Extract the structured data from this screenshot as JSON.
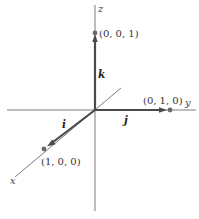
{
  "diagram": {
    "axes": {
      "x": {
        "label": "x"
      },
      "y": {
        "label": "y"
      },
      "z": {
        "label": "z"
      }
    },
    "vectors": [
      {
        "name": "i",
        "label": "i",
        "from": [
          0,
          0,
          0
        ],
        "to": [
          1,
          0,
          0
        ]
      },
      {
        "name": "j",
        "label": "j",
        "from": [
          0,
          0,
          0
        ],
        "to": [
          0,
          1,
          0
        ]
      },
      {
        "name": "k",
        "label": "k",
        "from": [
          0,
          0,
          0
        ],
        "to": [
          0,
          0,
          1
        ]
      }
    ],
    "points": [
      {
        "label": "(1, 0, 0)",
        "coords": [
          1,
          0,
          0
        ]
      },
      {
        "label": "(0, 1, 0)",
        "coords": [
          0,
          1,
          0
        ]
      },
      {
        "label": "(0, 0, 1)",
        "coords": [
          0,
          0,
          1
        ]
      }
    ],
    "colors": {
      "axis": "#6f6f6f",
      "vector": "#4a4a4a",
      "point": "#6a6a6a",
      "text": "#333333",
      "background": "#ffffff"
    }
  }
}
